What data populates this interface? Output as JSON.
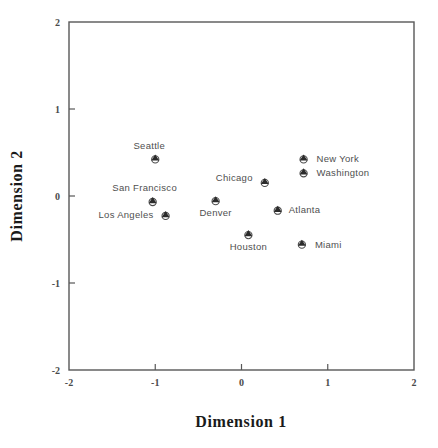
{
  "chart_data": {
    "type": "scatter",
    "title": "",
    "subtitle": "",
    "xlabel": "Dimension 1",
    "ylabel": "Dimension 2",
    "xlim": [
      -2,
      2
    ],
    "ylim": [
      -2,
      2
    ],
    "xticks": [
      -2,
      -1,
      0,
      1,
      2
    ],
    "yticks": [
      -2,
      -1,
      0,
      1,
      2
    ],
    "xtick_labels": [
      "-2",
      "-1",
      "0",
      "1",
      "2"
    ],
    "ytick_labels": [
      "-2",
      "-1",
      "0",
      "1",
      "2"
    ],
    "grid": false,
    "legend": "none",
    "marker_style": "circle-with-filled-triangle",
    "marker_color": "#2b2b2b",
    "frame_color": "#585858",
    "background_color": "#ffffff",
    "points": [
      {
        "label": "Seattle",
        "x": -1.0,
        "y": 0.43,
        "label_dx": -6,
        "label_dy": -10,
        "label_anchor": "middle"
      },
      {
        "label": "San Francisco",
        "x": -1.03,
        "y": -0.06,
        "label_dx": -8,
        "label_dy": -10,
        "label_anchor": "middle"
      },
      {
        "label": "Los Angeles",
        "x": -0.88,
        "y": -0.22,
        "label_dx": -12,
        "label_dy": 3,
        "label_anchor": "end"
      },
      {
        "label": "Denver",
        "x": -0.3,
        "y": -0.05,
        "label_dx": 0,
        "label_dy": 16,
        "label_anchor": "middle"
      },
      {
        "label": "Chicago",
        "x": 0.27,
        "y": 0.16,
        "label_dx": -12,
        "label_dy": -1,
        "label_anchor": "end"
      },
      {
        "label": "Houston",
        "x": 0.08,
        "y": -0.44,
        "label_dx": 0,
        "label_dy": 16,
        "label_anchor": "middle"
      },
      {
        "label": "Atlanta",
        "x": 0.42,
        "y": -0.16,
        "label_dx": 11,
        "label_dy": 3,
        "label_anchor": "start"
      },
      {
        "label": "New York",
        "x": 0.72,
        "y": 0.43,
        "label_dx": 13,
        "label_dy": 3,
        "label_anchor": "start"
      },
      {
        "label": "Washington",
        "x": 0.72,
        "y": 0.27,
        "label_dx": 13,
        "label_dy": 3,
        "label_anchor": "start"
      },
      {
        "label": "Miami",
        "x": 0.7,
        "y": -0.55,
        "label_dx": 13,
        "label_dy": 4,
        "label_anchor": "start"
      }
    ]
  }
}
